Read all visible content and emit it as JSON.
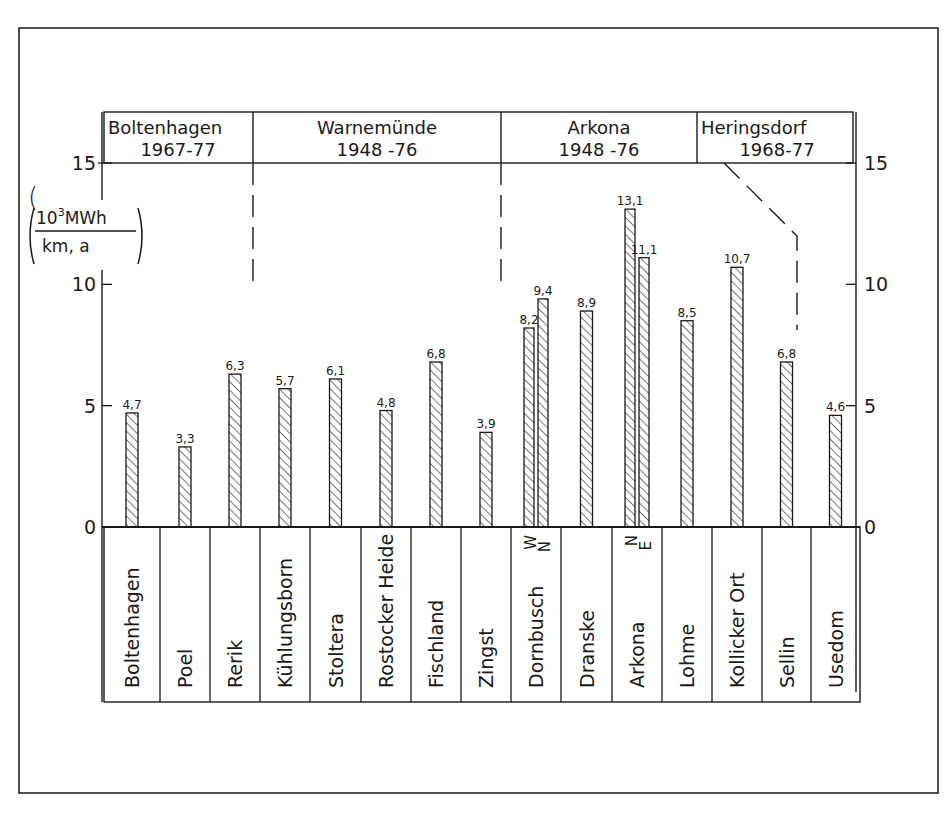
{
  "figure": {
    "unit_label": {
      "numerator": "10",
      "numerator_sup": "3",
      "numerator_unit": "MWh",
      "denominator": "km, a"
    },
    "station_headers": [
      {
        "name": "Boltenhagen",
        "years": "1967-77"
      },
      {
        "name": "Warnemünde",
        "years": "1948 -76"
      },
      {
        "name": "Arkona",
        "years": "1948 -76"
      },
      {
        "name": "Heringsdorf",
        "years": "1968-77"
      }
    ]
  },
  "chart_data": {
    "type": "bar",
    "title": "",
    "xlabel": "",
    "ylabel": "10^3 MWh / (km, a)",
    "ylim": [
      0,
      15
    ],
    "yticks": [
      0,
      5,
      10,
      15
    ],
    "grid": false,
    "secondary_y_axis": true,
    "categories": [
      "Boltenhagen",
      "Poel",
      "Rerik",
      "Kühlungsborn",
      "Stoltera",
      "Rostocker Heide",
      "Fischland",
      "Zingst",
      "Dornbusch",
      "Dranske",
      "Arkona",
      "Lohme",
      "Kollicker Ort",
      "Sellin",
      "Usedom"
    ],
    "bars": [
      {
        "category": "Boltenhagen",
        "values": [
          {
            "label": "",
            "value": 4.7,
            "text": "4,7"
          }
        ]
      },
      {
        "category": "Poel",
        "values": [
          {
            "label": "",
            "value": 3.3,
            "text": "3,3"
          }
        ]
      },
      {
        "category": "Rerik",
        "values": [
          {
            "label": "",
            "value": 6.3,
            "text": "6,3"
          }
        ]
      },
      {
        "category": "Kühlungsborn",
        "values": [
          {
            "label": "",
            "value": 5.7,
            "text": "5,7"
          }
        ]
      },
      {
        "category": "Stoltera",
        "values": [
          {
            "label": "",
            "value": 6.1,
            "text": "6,1"
          }
        ]
      },
      {
        "category": "Rostocker Heide",
        "values": [
          {
            "label": "",
            "value": 4.8,
            "text": "4,8"
          }
        ]
      },
      {
        "category": "Fischland",
        "values": [
          {
            "label": "",
            "value": 6.8,
            "text": "6,8"
          }
        ]
      },
      {
        "category": "Zingst",
        "values": [
          {
            "label": "",
            "value": 3.9,
            "text": "3,9"
          }
        ]
      },
      {
        "category": "Dornbusch",
        "values": [
          {
            "label": "W",
            "value": 8.2,
            "text": "8,2"
          },
          {
            "label": "N",
            "value": 9.4,
            "text": "9,4"
          }
        ]
      },
      {
        "category": "Dranske",
        "values": [
          {
            "label": "",
            "value": 8.9,
            "text": "8,9"
          }
        ]
      },
      {
        "category": "Arkona",
        "values": [
          {
            "label": "N",
            "value": 13.1,
            "text": "13,1"
          },
          {
            "label": "E",
            "value": 11.1,
            "text": "11,1"
          }
        ]
      },
      {
        "category": "Lohme",
        "values": [
          {
            "label": "",
            "value": 8.5,
            "text": "8,5"
          }
        ]
      },
      {
        "category": "Kollicker Ort",
        "values": [
          {
            "label": "",
            "value": 10.7,
            "text": "10,7"
          }
        ]
      },
      {
        "category": "Sellin",
        "values": [
          {
            "label": "",
            "value": 6.8,
            "text": "6,8"
          }
        ]
      },
      {
        "category": "Usedom",
        "values": [
          {
            "label": "",
            "value": 4.6,
            "text": "4,6"
          }
        ]
      }
    ],
    "region_groups": [
      {
        "name": "Boltenhagen",
        "period": "1967-77",
        "categories": [
          "Boltenhagen",
          "Poel",
          "Rerik"
        ]
      },
      {
        "name": "Warnemünde",
        "period": "1948 -76",
        "categories": [
          "Kühlungsborn",
          "Stoltera",
          "Rostocker Heide",
          "Fischland",
          "Zingst"
        ]
      },
      {
        "name": "Arkona",
        "period": "1948 -76",
        "categories": [
          "Dornbusch",
          "Dranske",
          "Arkona",
          "Lohme",
          "Kollicker Ort"
        ]
      },
      {
        "name": "Heringsdorf",
        "period": "1968-77",
        "categories": [
          "Sellin",
          "Usedom"
        ]
      }
    ],
    "annotations": [
      "hatched bars",
      "dashed separators between station regions"
    ]
  }
}
